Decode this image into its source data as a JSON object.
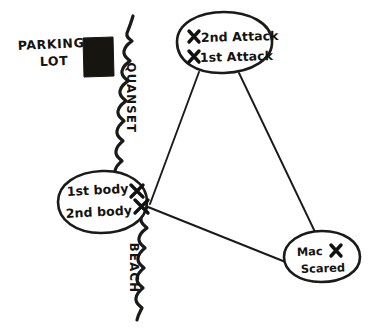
{
  "diagram": {
    "background_color": "#ffffff",
    "ink_color": "#1a1a18",
    "fill_color": "#17150f"
  },
  "areas": {
    "parking_lot": {
      "label_line1": "PARKING",
      "label_line2": "LOT",
      "name": "parking-lot"
    },
    "quanset": {
      "label": "QUANSET",
      "orientation": "vertical"
    },
    "beach": {
      "label": "BEACH",
      "orientation": "vertical"
    }
  },
  "nodes": [
    {
      "id": "attacks",
      "name": "attacks-node",
      "lines": [
        {
          "mark": "x",
          "text": "2nd Attack"
        },
        {
          "mark": "x",
          "text": "1st Attack"
        }
      ]
    },
    {
      "id": "bodies",
      "name": "bodies-node",
      "lines": [
        {
          "text": "1st body",
          "mark": "x"
        },
        {
          "text": "2nd body",
          "mark": "x"
        }
      ]
    },
    {
      "id": "mac",
      "name": "mac-node",
      "lines": [
        {
          "text": "Mac",
          "mark": "x"
        },
        {
          "text": "Scared",
          "mark": ""
        }
      ]
    }
  ],
  "connectors": [
    {
      "from": "attacks",
      "to": "bodies"
    },
    {
      "from": "attacks",
      "to": "mac"
    },
    {
      "from": "bodies",
      "to": "mac"
    }
  ],
  "x_marks_total": 5
}
